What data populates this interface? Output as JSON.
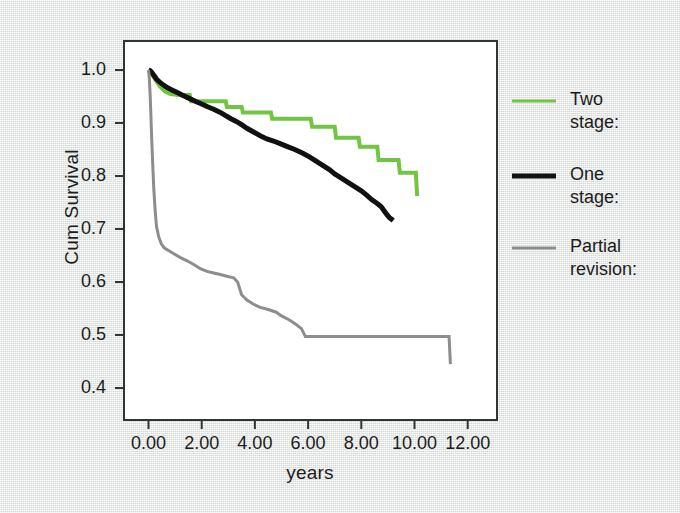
{
  "chart_data": {
    "type": "line",
    "title": "",
    "xlabel": "years",
    "ylabel": "Cum Survival",
    "xlim": [
      -0.5,
      12.6
    ],
    "ylim": [
      0.36,
      1.03
    ],
    "xticks": [
      "0.00",
      "2.00",
      "4.00",
      "6.00",
      "8.00",
      "10.00",
      "12.00"
    ],
    "xtick_values": [
      0,
      2,
      4,
      6,
      8,
      10,
      12
    ],
    "yticks": [
      "1.0",
      "0.9",
      "0.8",
      "0.7",
      "0.6",
      "0.5",
      "0.4"
    ],
    "ytick_values": [
      1.0,
      0.9,
      0.8,
      0.7,
      0.6,
      0.5,
      0.4
    ],
    "grid": false,
    "legend_position": "right",
    "series": [
      {
        "name": "Two stage:",
        "color": "#72c443",
        "width": 4,
        "points": [
          [
            0.0,
            1.0
          ],
          [
            0.08,
            0.995
          ],
          [
            0.18,
            0.988
          ],
          [
            0.3,
            0.978
          ],
          [
            0.45,
            0.968
          ],
          [
            0.6,
            0.96
          ],
          [
            0.8,
            0.955
          ],
          [
            1.1,
            0.953
          ],
          [
            1.55,
            0.953
          ],
          [
            1.6,
            0.941
          ],
          [
            2.9,
            0.941
          ],
          [
            2.95,
            0.93
          ],
          [
            3.5,
            0.93
          ],
          [
            3.55,
            0.92
          ],
          [
            4.6,
            0.92
          ],
          [
            4.65,
            0.908
          ],
          [
            6.1,
            0.908
          ],
          [
            6.15,
            0.893
          ],
          [
            7.0,
            0.893
          ],
          [
            7.05,
            0.872
          ],
          [
            7.9,
            0.872
          ],
          [
            7.95,
            0.855
          ],
          [
            8.6,
            0.855
          ],
          [
            8.65,
            0.83
          ],
          [
            9.4,
            0.83
          ],
          [
            9.45,
            0.806
          ],
          [
            10.05,
            0.806
          ],
          [
            10.1,
            0.762
          ]
        ]
      },
      {
        "name": "One stage:",
        "color": "#111111",
        "width": 5,
        "points": [
          [
            0.0,
            1.0
          ],
          [
            0.05,
            0.999
          ],
          [
            0.12,
            0.996
          ],
          [
            0.2,
            0.99
          ],
          [
            0.3,
            0.983
          ],
          [
            0.4,
            0.978
          ],
          [
            0.55,
            0.972
          ],
          [
            0.7,
            0.967
          ],
          [
            0.9,
            0.962
          ],
          [
            1.1,
            0.957
          ],
          [
            1.3,
            0.952
          ],
          [
            1.55,
            0.946
          ],
          [
            1.8,
            0.94
          ],
          [
            2.0,
            0.936
          ],
          [
            2.2,
            0.931
          ],
          [
            2.45,
            0.926
          ],
          [
            2.7,
            0.92
          ],
          [
            2.9,
            0.914
          ],
          [
            3.1,
            0.908
          ],
          [
            3.3,
            0.903
          ],
          [
            3.5,
            0.897
          ],
          [
            3.7,
            0.89
          ],
          [
            3.95,
            0.883
          ],
          [
            4.2,
            0.876
          ],
          [
            4.45,
            0.87
          ],
          [
            4.7,
            0.866
          ],
          [
            4.95,
            0.861
          ],
          [
            5.2,
            0.856
          ],
          [
            5.5,
            0.85
          ],
          [
            5.8,
            0.843
          ],
          [
            6.05,
            0.836
          ],
          [
            6.3,
            0.828
          ],
          [
            6.55,
            0.82
          ],
          [
            6.8,
            0.812
          ],
          [
            7.0,
            0.804
          ],
          [
            7.25,
            0.796
          ],
          [
            7.5,
            0.788
          ],
          [
            7.75,
            0.78
          ],
          [
            8.0,
            0.772
          ],
          [
            8.2,
            0.764
          ],
          [
            8.4,
            0.755
          ],
          [
            8.6,
            0.748
          ],
          [
            8.75,
            0.742
          ],
          [
            8.85,
            0.735
          ],
          [
            8.95,
            0.728
          ],
          [
            9.05,
            0.722
          ],
          [
            9.2,
            0.716
          ]
        ]
      },
      {
        "name": "Partial revision:",
        "color": "#8d8d8d",
        "width": 3,
        "points": [
          [
            0.0,
            1.0
          ],
          [
            0.03,
            0.985
          ],
          [
            0.06,
            0.955
          ],
          [
            0.09,
            0.915
          ],
          [
            0.12,
            0.87
          ],
          [
            0.16,
            0.82
          ],
          [
            0.2,
            0.775
          ],
          [
            0.25,
            0.735
          ],
          [
            0.3,
            0.705
          ],
          [
            0.38,
            0.686
          ],
          [
            0.48,
            0.672
          ],
          [
            0.6,
            0.664
          ],
          [
            0.8,
            0.658
          ],
          [
            1.0,
            0.652
          ],
          [
            1.2,
            0.646
          ],
          [
            1.45,
            0.64
          ],
          [
            1.7,
            0.633
          ],
          [
            1.95,
            0.625
          ],
          [
            2.2,
            0.62
          ],
          [
            2.45,
            0.617
          ],
          [
            2.7,
            0.614
          ],
          [
            2.95,
            0.611
          ],
          [
            3.2,
            0.608
          ],
          [
            3.35,
            0.6
          ],
          [
            3.5,
            0.576
          ],
          [
            3.7,
            0.566
          ],
          [
            3.95,
            0.558
          ],
          [
            4.2,
            0.552
          ],
          [
            4.5,
            0.548
          ],
          [
            4.8,
            0.543
          ],
          [
            5.0,
            0.536
          ],
          [
            5.2,
            0.531
          ],
          [
            5.4,
            0.525
          ],
          [
            5.6,
            0.518
          ],
          [
            5.75,
            0.512
          ],
          [
            5.9,
            0.497
          ],
          [
            11.3,
            0.497
          ],
          [
            11.35,
            0.445
          ]
        ]
      }
    ]
  },
  "legend": {
    "entries": [
      {
        "label": "Two\nstage:",
        "color": "#72c443"
      },
      {
        "label": "One\nstage:",
        "color": "#111111"
      },
      {
        "label": "Partial\nrevision:",
        "color": "#8d8d8d"
      }
    ]
  },
  "colors": {
    "green": "#72c443",
    "black": "#111111",
    "gray": "#8d8d8d",
    "axis": "#222222",
    "plot_background": "#ffffff",
    "page_background": "#e8e9e9"
  }
}
